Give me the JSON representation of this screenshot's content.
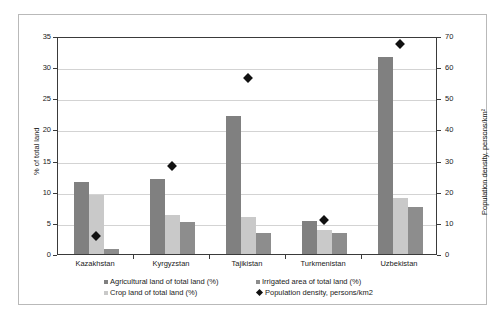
{
  "chart_data": {
    "type": "bar",
    "title": "",
    "subtitle": "",
    "categories": [
      "Kazakhstan",
      "Kyrgyzstan",
      "Tajikistan",
      "Turkmenistan",
      "Uzbekistan"
    ],
    "series": [
      {
        "name": "Agricultural land of total land (%)",
        "axis": "left",
        "type": "bar",
        "color": "#808080",
        "values": [
          11.5,
          12.0,
          22.2,
          5.3,
          31.7
        ]
      },
      {
        "name": "Crop land of total land (%)",
        "axis": "left",
        "type": "bar",
        "color": "#c9c9c9",
        "values": [
          9.4,
          6.3,
          5.9,
          3.9,
          9.0
        ]
      },
      {
        "name": "Irrigated area of total land (%)",
        "axis": "left",
        "type": "bar",
        "color": "#8d8d8d",
        "values": [
          0.8,
          5.1,
          3.3,
          3.4,
          7.5
        ]
      },
      {
        "name": "Population density, persons/km2",
        "axis": "right",
        "type": "scatter",
        "marker": "diamond",
        "color": "#111111",
        "values": [
          6.4,
          29.0,
          57.3,
          11.5,
          68.0
        ]
      }
    ],
    "xlabel": "",
    "ylabel": "% of total land",
    "ylabel_right": "Population density, persons/km²",
    "ylim": [
      0,
      35
    ],
    "yticks": [
      0,
      5,
      10,
      15,
      20,
      25,
      30,
      35
    ],
    "ylim_right": [
      0,
      70
    ],
    "yticks_right": [
      0,
      10,
      20,
      30,
      40,
      50,
      60,
      70
    ],
    "grid": true,
    "legend_position": "bottom"
  },
  "axes": {
    "left": {
      "title": "% of total land",
      "ticks": [
        "0",
        "5",
        "10",
        "15",
        "20",
        "25",
        "30",
        "35"
      ]
    },
    "right": {
      "title": "Population density, persons/km²",
      "ticks": [
        "0",
        "10",
        "20",
        "30",
        "40",
        "50",
        "60",
        "70"
      ]
    },
    "categories": [
      "Kazakhstan",
      "Kyrgyzstan",
      "Tajikistan",
      "Turkmenistan",
      "Uzbekistan"
    ]
  },
  "legend": {
    "items": [
      {
        "label": "Agricultural land of total land (%)",
        "swatch": "agricultural"
      },
      {
        "label": "Crop land of total land (%)",
        "swatch": "crop"
      },
      {
        "label": "Irrigated area of total land (%)",
        "swatch": "irrigated"
      },
      {
        "label": "Population density, persons/km2",
        "swatch": "density"
      }
    ]
  }
}
